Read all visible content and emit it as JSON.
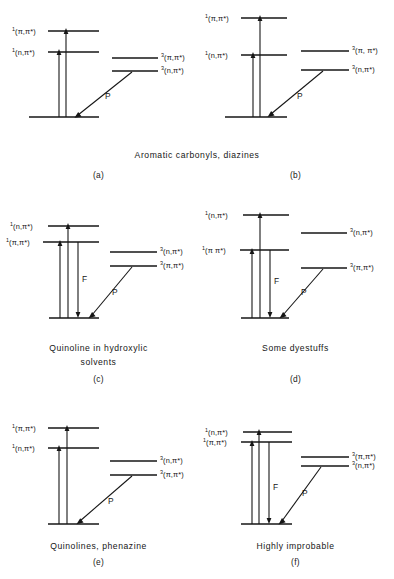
{
  "figure": {
    "type": "energy-level-diagram-set",
    "panels": [
      {
        "id": "a",
        "letter": "(a)",
        "caption": "",
        "shared_caption_with": "b",
        "singlets": [
          {
            "label_sup": "1",
            "label": "(π,π*)",
            "y": 31
          },
          {
            "label_sup": "1",
            "label": "(n,π*)",
            "y": 52
          }
        ],
        "triplets": [
          {
            "label_sup": "3",
            "label": "(π,π*)",
            "y": 58
          },
          {
            "label_sup": "3",
            "label": "(n,π*)",
            "y": 71
          }
        ],
        "ground_y": 117,
        "transitions": [
          {
            "name": "absorption",
            "label": "",
            "dir": "up"
          },
          {
            "name": "absorption",
            "label": "",
            "dir": "up"
          },
          {
            "name": "phosphorescence",
            "label": "P",
            "dir": "down-left"
          }
        ]
      },
      {
        "id": "b",
        "letter": "(b)",
        "caption": "",
        "shared_caption_with": "a",
        "singlets": [
          {
            "label_sup": "1",
            "label": "(π,π*)",
            "y": 18
          },
          {
            "label_sup": "1",
            "label": "(n,π*)",
            "y": 55
          }
        ],
        "triplets": [
          {
            "label_sup": "3",
            "label": "(π, π*)",
            "y": 51
          },
          {
            "label_sup": "3",
            "label": "(n,π*)",
            "y": 70
          }
        ],
        "ground_y": 117,
        "transitions": [
          {
            "name": "absorption",
            "label": "",
            "dir": "up"
          },
          {
            "name": "absorption",
            "label": "",
            "dir": "up"
          },
          {
            "name": "phosphorescence",
            "label": "P",
            "dir": "down-left"
          }
        ]
      },
      {
        "id": "c",
        "letter": "(c)",
        "caption": "Quinoline in hydroxylic\nsolvents",
        "caption_line1": "Quinoline in hydroxylic",
        "caption_line2": "solvents",
        "singlets": [
          {
            "label_sup": "1",
            "label": "(n,π*)",
            "y": 36
          },
          {
            "label_sup": "1",
            "label": "(π,π*)",
            "y": 52
          }
        ],
        "triplets": [
          {
            "label_sup": "3",
            "label": "(n,π*)",
            "y": 62
          },
          {
            "label_sup": "3",
            "label": "(π,π*)",
            "y": 76
          }
        ],
        "ground_y": 128,
        "transitions": [
          {
            "name": "absorption",
            "label": "",
            "dir": "up"
          },
          {
            "name": "fluorescence",
            "label": "F",
            "dir": "down"
          },
          {
            "name": "phosphorescence",
            "label": "P",
            "dir": "down-left"
          }
        ]
      },
      {
        "id": "d",
        "letter": "(d)",
        "caption": "Some dyestuffs",
        "caption_line1": "Some dyestuffs",
        "caption_line2": "",
        "singlets": [
          {
            "label_sup": "1",
            "label": "(n,π*)",
            "y": 25
          },
          {
            "label_sup": "1",
            "label": "(π π*)",
            "y": 60
          }
        ],
        "triplets": [
          {
            "label_sup": "3",
            "label": "(n,π*)",
            "y": 43
          },
          {
            "label_sup": "3",
            "label": "(π,π*)",
            "y": 78
          }
        ],
        "ground_y": 128,
        "transitions": [
          {
            "name": "absorption",
            "label": "",
            "dir": "up"
          },
          {
            "name": "fluorescence",
            "label": "F",
            "dir": "down"
          },
          {
            "name": "phosphorescence",
            "label": "P",
            "dir": "down-left"
          }
        ]
      },
      {
        "id": "e",
        "letter": "(e)",
        "caption": "Quinolines, phenazine",
        "caption_line1": "Quinolines, phenazine",
        "caption_line2": "",
        "singlets": [
          {
            "label_sup": "1",
            "label": "(π,π*)",
            "y": 28
          },
          {
            "label_sup": "1",
            "label": "(n,π*)",
            "y": 48
          }
        ],
        "triplets": [
          {
            "label_sup": "3",
            "label": "(n,π*)",
            "y": 61
          },
          {
            "label_sup": "3",
            "label": "(π,π*)",
            "y": 75
          }
        ],
        "ground_y": 124,
        "transitions": [
          {
            "name": "absorption",
            "label": "",
            "dir": "up"
          },
          {
            "name": "absorption",
            "label": "",
            "dir": "up"
          },
          {
            "name": "phosphorescence",
            "label": "P",
            "dir": "down-left"
          }
        ]
      },
      {
        "id": "f",
        "letter": "(f)",
        "caption": "Highly improbable",
        "caption_line1": "Highly improbable",
        "caption_line2": "",
        "singlets": [
          {
            "label_sup": "1",
            "label": "(n,π*)",
            "y": 32
          },
          {
            "label_sup": "1",
            "label": "(π,π*)",
            "y": 42
          }
        ],
        "triplets": [
          {
            "label_sup": "3",
            "label": "(π,π*)",
            "y": 57
          },
          {
            "label_sup": "3",
            "label": "(n,π*)",
            "y": 66
          }
        ],
        "ground_y": 124,
        "transitions": [
          {
            "name": "absorption",
            "label": "",
            "dir": "up"
          },
          {
            "name": "fluorescence",
            "label": "F",
            "dir": "down"
          },
          {
            "name": "phosphorescence",
            "label": "P",
            "dir": "down-left"
          }
        ]
      }
    ],
    "shared_caption_ab": "Aromatic  carbonyls,  diazines",
    "labels": {
      "fluorescence": "F",
      "phosphorescence": "P"
    },
    "colors": {
      "ink": "#161616",
      "background": "#ffffff"
    }
  }
}
